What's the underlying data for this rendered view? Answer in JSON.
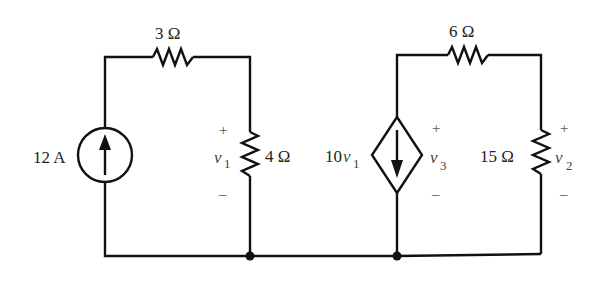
{
  "circuit": {
    "source_12A": {
      "label": "12 A",
      "type": "independent current source",
      "direction": "up"
    },
    "r3": {
      "label": "3 Ω"
    },
    "r4": {
      "label": "4 Ω",
      "voltage": {
        "var": "v",
        "sub": "1",
        "plus": "+",
        "minus": "–"
      }
    },
    "dep_source": {
      "coef": "10",
      "var": "v",
      "sub": "1",
      "type": "dependent current source",
      "direction": "down",
      "voltage": {
        "var": "v",
        "sub": "3",
        "plus": "+",
        "minus": "–"
      }
    },
    "r6": {
      "label": "6 Ω"
    },
    "r15": {
      "label": "15 Ω",
      "voltage": {
        "var": "v",
        "sub": "2",
        "plus": "+",
        "minus": "–"
      }
    }
  }
}
